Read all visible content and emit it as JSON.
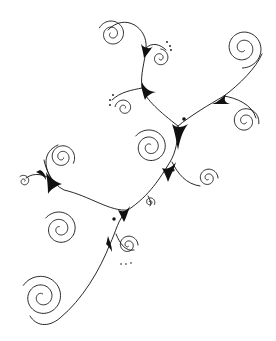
{
  "image": {
    "subject": "decorative swirl filigree line drawing",
    "background_color": "#ffffff",
    "ink_color": "#111111",
    "elements": [
      {
        "name": "spiral-top-left",
        "type": "spiral"
      },
      {
        "name": "spiral-top-small",
        "type": "spiral"
      },
      {
        "name": "spiral-top-right",
        "type": "spiral"
      },
      {
        "name": "spiral-mid-left-small",
        "type": "spiral"
      },
      {
        "name": "spiral-center",
        "type": "spiral"
      },
      {
        "name": "spiral-right-mid",
        "type": "spiral"
      },
      {
        "name": "spiral-right-lower",
        "type": "spiral"
      },
      {
        "name": "spiral-center-tiny",
        "type": "spiral"
      },
      {
        "name": "spiral-left-upper",
        "type": "spiral"
      },
      {
        "name": "spiral-left-tiny",
        "type": "spiral"
      },
      {
        "name": "spiral-left-mid",
        "type": "spiral"
      },
      {
        "name": "spiral-bottom-small",
        "type": "spiral"
      },
      {
        "name": "spiral-bottom-left",
        "type": "spiral"
      }
    ],
    "dot_clusters": 3,
    "single_dots": 3
  }
}
